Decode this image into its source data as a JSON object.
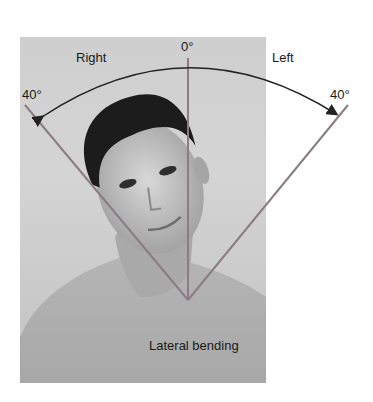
{
  "figure": {
    "labels": {
      "zero": "0°",
      "right": "Right",
      "left": "Left",
      "right_angle": "40°",
      "left_angle": "40°",
      "caption": "Lateral bending"
    },
    "colors": {
      "line": "#8a7d86",
      "arc": "#222222",
      "photo_bg": "#cfcfcf",
      "hair": "#1c1c1c",
      "skin": "#b8b8b8"
    }
  }
}
